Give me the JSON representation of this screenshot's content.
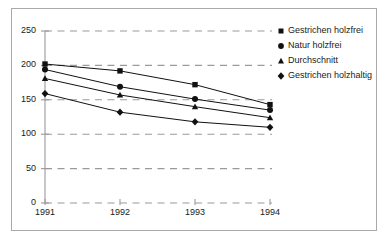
{
  "chart_data": {
    "type": "line",
    "title": "",
    "subtitle": "",
    "xlabel": "",
    "ylabel": "",
    "categories": [
      "1991",
      "1992",
      "1993",
      "1994"
    ],
    "x_tick_labels": [
      "1991",
      "1992",
      "1993",
      "1994"
    ],
    "y_tick_labels": [
      "0",
      "50",
      "100",
      "150",
      "200",
      "250"
    ],
    "y_ticks": [
      0,
      50,
      100,
      150,
      200,
      250
    ],
    "ylim": [
      0,
      250
    ],
    "grid": "horizontal-dashed",
    "legend_position": "right",
    "series": [
      {
        "name": "Gestrichen holzfrei",
        "marker": "square",
        "values": [
          202,
          192,
          172,
          143
        ]
      },
      {
        "name": "Natur holzfrei",
        "marker": "circle",
        "values": [
          194,
          169,
          151,
          135
        ]
      },
      {
        "name": "Durchschnitt",
        "marker": "triangle",
        "values": [
          181,
          157,
          140,
          124
        ]
      },
      {
        "name": "Gestrichen holzhaltig",
        "marker": "diamond",
        "values": [
          159,
          132,
          118,
          110
        ]
      }
    ]
  },
  "colors": {
    "series_line": "#111111",
    "marker": "#111111",
    "grid": "#9a9a9a",
    "axis": "#9a9a9a",
    "frame": "#a9a9a9",
    "text": "#1a1a1a",
    "background": "#ffffff"
  },
  "legend": {
    "items": [
      {
        "label": "Gestrichen holzfrei",
        "marker": "square-marker"
      },
      {
        "label": "Natur holzfrei",
        "marker": "circle-marker"
      },
      {
        "label": "Durchschnitt",
        "marker": "triangle-marker"
      },
      {
        "label": "Gestrichen holzhaltig",
        "marker": "diamond-marker"
      }
    ]
  }
}
